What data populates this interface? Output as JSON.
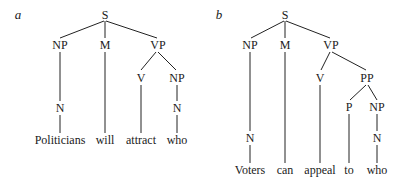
{
  "trees": [
    {
      "panel_label": "a",
      "nodes": {
        "S": "S",
        "NP": "NP",
        "M": "M",
        "VP": "VP",
        "V": "V",
        "NP2": "NP",
        "N1": "N",
        "N2": "N"
      },
      "words": [
        "Politicians",
        "will",
        "attract",
        "who"
      ]
    },
    {
      "panel_label": "b",
      "nodes": {
        "S": "S",
        "NP": "NP",
        "M": "M",
        "VP": "VP",
        "V": "V",
        "PP": "PP",
        "P": "P",
        "NP2": "NP",
        "N1": "N",
        "N2": "N"
      },
      "words": [
        "Voters",
        "can",
        "appeal",
        "to",
        "who"
      ]
    }
  ]
}
